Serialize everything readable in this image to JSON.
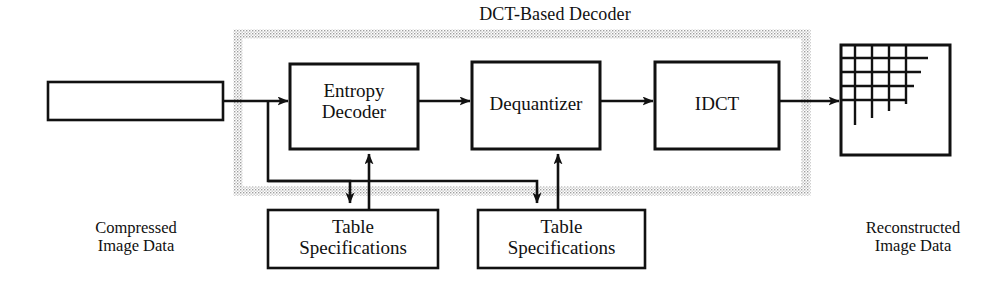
{
  "diagram": {
    "title": "DCT-Based Decoder",
    "title_region_name": "dct-based-decoder-group",
    "colors": {
      "stroke": "#111111",
      "background": "#ffffff",
      "dotted_border": "#b8b8b8"
    },
    "input": {
      "box_name": "compressed-image-data-box",
      "caption": "Compressed\nImage Data"
    },
    "output": {
      "box_name": "reconstructed-image-box",
      "caption": "Reconstructed\nImage Data"
    },
    "stages": [
      {
        "id": "entropy-decoder",
        "label": "Entropy\nDecoder"
      },
      {
        "id": "dequantizer",
        "label": "Dequantizer"
      },
      {
        "id": "idct",
        "label": "IDCT"
      }
    ],
    "tables": [
      {
        "id": "table-specifications-entropy",
        "label": "Table\nSpecifications"
      },
      {
        "id": "table-specifications-dequantizer",
        "label": "Table\nSpecifications"
      }
    ]
  }
}
